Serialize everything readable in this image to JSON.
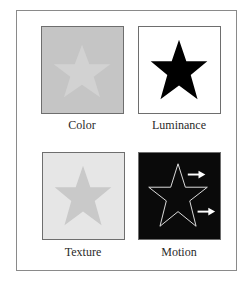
{
  "figure": {
    "panels": [
      {
        "id": "color",
        "label": "Color",
        "background": "#c5c5c5",
        "star_fill": "#d2d2d2",
        "star_stroke": "none"
      },
      {
        "id": "luminance",
        "label": "Luminance",
        "background": "#ffffff",
        "star_fill": "#000000",
        "star_stroke": "none"
      },
      {
        "id": "texture",
        "label": "Texture",
        "background": "#e6e6e6",
        "star_fill": "#c9c9c9",
        "star_stroke": "none"
      },
      {
        "id": "motion",
        "label": "Motion",
        "background": "#0a0a0a",
        "star_fill": "none",
        "star_stroke": "#e0e0e0",
        "arrows": 2
      }
    ],
    "icons": {
      "star": "star-icon",
      "arrow": "arrow-right-icon"
    }
  }
}
